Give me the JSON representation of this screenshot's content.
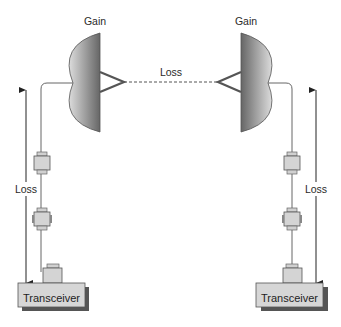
{
  "diagram": {
    "type": "point-to-point wireless link budget",
    "labels": {
      "left_antenna_gain": "Gain",
      "right_antenna_gain": "Gain",
      "free_space_loss": "Loss",
      "left_cable_loss": "Loss",
      "right_cable_loss": "Loss",
      "left_transceiver": "Transceiver",
      "right_transceiver": "Transceiver"
    },
    "colors": {
      "dish_dark": "#6e6e6e",
      "dish_light": "#d8d8d8",
      "box_fill": "#d4d4d4",
      "box_shadow": "#555555",
      "line": "#444444"
    }
  }
}
